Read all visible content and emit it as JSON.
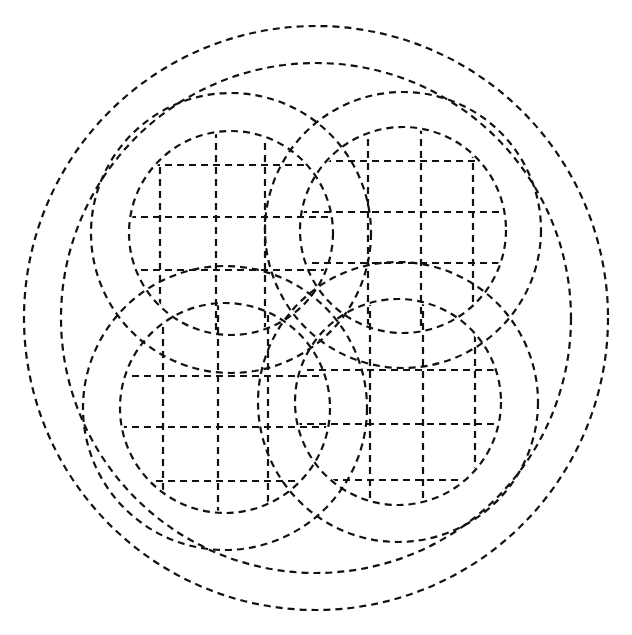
{
  "figure": {
    "line_color": "#111111",
    "background": "#ffffff",
    "line_style": "dashed"
  },
  "outer_circles": [
    {
      "cx": 316,
      "cy": 318,
      "r": 292
    },
    {
      "cx": 316,
      "cy": 318,
      "r": 255
    }
  ],
  "rings": [
    {
      "name": "top-left",
      "cx": 231,
      "cy": 233,
      "r_outer": 140,
      "r_inner": 102,
      "grid_x": [
        160,
        216,
        265
      ],
      "grid_y": [
        165,
        217,
        270
      ]
    },
    {
      "name": "top-right",
      "cx": 403,
      "cy": 230,
      "r_outer": 138,
      "r_inner": 103,
      "grid_x": [
        368,
        421,
        473
      ],
      "grid_y": [
        161,
        212,
        263
      ]
    },
    {
      "name": "bottom-left",
      "cx": 225,
      "cy": 408,
      "r_outer": 142,
      "r_inner": 105,
      "grid_x": [
        163,
        218,
        268
      ],
      "grid_y": [
        376,
        427,
        481
      ]
    },
    {
      "name": "bottom-right",
      "cx": 398,
      "cy": 402,
      "r_outer": 140,
      "r_inner": 103,
      "grid_x": [
        370,
        423,
        475
      ],
      "grid_y": [
        370,
        424,
        480
      ]
    }
  ]
}
